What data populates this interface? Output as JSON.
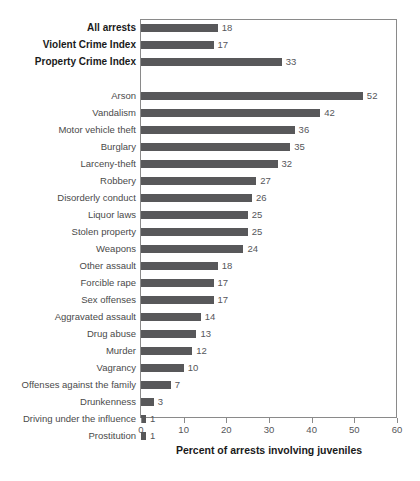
{
  "chart_data": {
    "type": "bar",
    "orientation": "horizontal",
    "title": "",
    "xlabel": "Percent of arrests involving juveniles",
    "ylabel": "",
    "xlim": [
      0,
      60
    ],
    "xticks": [
      0,
      10,
      20,
      30,
      40,
      50,
      60
    ],
    "grid": false,
    "legend": null,
    "bar_color": "#58585a",
    "groups": [
      {
        "name": "summary",
        "bold": true,
        "categories": [
          "All arrests",
          "Violent Crime Index",
          "Property Crime Index"
        ],
        "values": [
          18,
          17,
          33
        ]
      },
      {
        "name": "offenses",
        "bold": false,
        "categories": [
          "Arson",
          "Vandalism",
          "Motor vehicle theft",
          "Burglary",
          "Larceny-theft",
          "Robbery",
          "Disorderly conduct",
          "Liquor laws",
          "Stolen property",
          "Weapons",
          "Other assault",
          "Forcible rape",
          "Sex offenses",
          "Aggravated assault",
          "Drug abuse",
          "Murder",
          "Vagrancy",
          "Offenses against the family",
          "Drunkenness",
          "Driving under the influence",
          "Prostitution"
        ],
        "values": [
          52,
          42,
          36,
          35,
          32,
          27,
          26,
          25,
          25,
          24,
          18,
          17,
          17,
          14,
          13,
          12,
          10,
          7,
          3,
          1,
          1
        ]
      }
    ],
    "categories": [
      "All arrests",
      "Violent Crime Index",
      "Property Crime Index",
      "Arson",
      "Vandalism",
      "Motor vehicle theft",
      "Burglary",
      "Larceny-theft",
      "Robbery",
      "Disorderly conduct",
      "Liquor laws",
      "Stolen property",
      "Weapons",
      "Other assault",
      "Forcible rape",
      "Sex offenses",
      "Aggravated assault",
      "Drug abuse",
      "Murder",
      "Vagrancy",
      "Offenses against the family",
      "Drunkenness",
      "Driving under the influence",
      "Prostitution"
    ],
    "values": [
      18,
      17,
      33,
      52,
      42,
      36,
      35,
      32,
      27,
      26,
      25,
      25,
      24,
      18,
      17,
      17,
      14,
      13,
      12,
      10,
      7,
      3,
      1,
      1
    ]
  }
}
